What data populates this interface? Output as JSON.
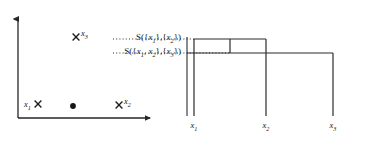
{
  "figure": {
    "width": 381,
    "height": 141,
    "background": "#ffffff",
    "ink_color": "#262626"
  },
  "scatter": {
    "axes": {
      "y_axis_name": "vertical-axis-arrow",
      "x_axis_name": "horizontal-axis-arrow",
      "origin": {
        "x": 18,
        "y": 118
      },
      "y_top": 17,
      "x_right": 152
    },
    "points": [
      {
        "id": "x1",
        "label": "x",
        "sub": "1",
        "marker": "cross",
        "label_side": "left",
        "px": 38,
        "py": 104
      },
      {
        "id": "x3",
        "label": "x",
        "sub": "3",
        "marker": "cross",
        "label_side": "right",
        "px": 76,
        "py": 37
      },
      {
        "id": "x2",
        "label": "x",
        "sub": "2",
        "marker": "cross",
        "label_side": "right",
        "px": 119,
        "py": 105
      },
      {
        "id": "unlabeled",
        "label": "",
        "sub": "",
        "marker": "dot",
        "label_side": "none",
        "px": 73,
        "py": 106
      }
    ]
  },
  "dendrogram": {
    "leaves": [
      {
        "id": "x1",
        "label": "x",
        "sub": "1",
        "px": 29
      },
      {
        "id": "x2",
        "label": "x",
        "sub": "2",
        "px": 101
      },
      {
        "id": "x3",
        "label": "x",
        "sub": "3",
        "px": 168
      }
    ],
    "baseline_y": 116,
    "axis_x": 22,
    "axis_top_y": 37,
    "merges": [
      {
        "id": "merge-x1-x2",
        "height_y": 39,
        "left_px": 29,
        "right_px": 101,
        "label_text_prefix": "S({",
        "label": "S({x1},{x2})"
      },
      {
        "id": "merge-x12-x3",
        "height_y": 53,
        "left_px": 65,
        "right_px": 168,
        "label": "S({x1, x2},{x3})"
      }
    ],
    "similarity_labels": [
      {
        "id": "sim-upper",
        "y": 39,
        "parts": [
          "S({",
          "x",
          "1",
          "},{",
          "x",
          "2",
          "})"
        ],
        "text": "S({x1},{x2})"
      },
      {
        "id": "sim-lower",
        "y": 53,
        "parts": [
          "S({",
          "x",
          "1",
          ", ",
          "x",
          "2",
          "},{",
          "x",
          "3",
          "})"
        ],
        "text": "S({x1, x2},{x3})"
      }
    ],
    "leader_lines": {
      "style": "dotted",
      "upper_from_x": -70,
      "lower_from_x": -90
    }
  }
}
